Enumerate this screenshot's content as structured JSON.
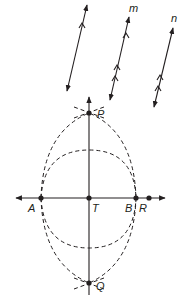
{
  "diagram": {
    "type": "geometric-construction",
    "parallel_lines": [
      {
        "name": "l",
        "label": "",
        "tick_marks": 1
      },
      {
        "name": "m",
        "label": "m",
        "tick_marks": 3
      },
      {
        "name": "n",
        "label": "n",
        "tick_marks": 2
      }
    ],
    "points": {
      "P": "P",
      "Q": "Q",
      "A": "A",
      "T": "T",
      "B": "B",
      "R": "R"
    },
    "colors": {
      "ink": "#231f20",
      "background": "#ffffff"
    }
  }
}
